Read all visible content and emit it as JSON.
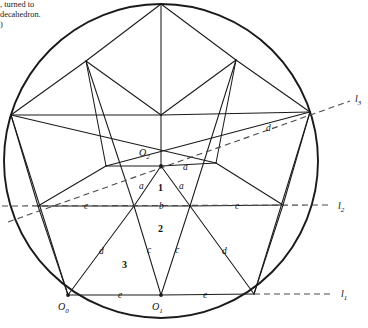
{
  "caption": {
    "text": ", turned to\ndecahedron.\n)"
  },
  "figure": {
    "circle": {
      "cx": 161,
      "cy": 161,
      "r": 157,
      "stroke": "#1a1a1a",
      "width": 1.9
    },
    "stroke_color": "#1a1a1a",
    "dash_color": "#4a4a4a",
    "points": {
      "apex": {
        "x": 161,
        "y": 4,
        "name": "apex-vertex"
      },
      "top_left": {
        "x": 86,
        "y": 61,
        "name": "top-left-vertex"
      },
      "top_right": {
        "x": 236,
        "y": 60,
        "name": "top-right-vertex"
      },
      "left": {
        "x": 11,
        "y": 115,
        "name": "left-vertex"
      },
      "right": {
        "x": 310,
        "y": 112,
        "name": "right-vertex"
      },
      "mid_top": {
        "x": 161,
        "y": 115,
        "name": "upper-center-node"
      },
      "inner_left": {
        "x": 106,
        "y": 166,
        "name": "inner-left-node"
      },
      "inner_right": {
        "x": 216,
        "y": 163,
        "name": "inner-right-node"
      },
      "O2": {
        "x": 161,
        "y": 166,
        "name": "point-O2"
      },
      "l2_left": {
        "x": 38,
        "y": 206,
        "name": "left-chord-node"
      },
      "l2_right": {
        "x": 283,
        "y": 205,
        "name": "right-chord-node"
      },
      "b_left": {
        "x": 134,
        "y": 206,
        "name": "b-left-node"
      },
      "b_right": {
        "x": 190,
        "y": 206,
        "name": "b-right-node"
      },
      "O0": {
        "x": 68,
        "y": 295,
        "name": "point-O0"
      },
      "O1": {
        "x": 161,
        "y": 295,
        "name": "point-O1"
      },
      "bottom_right": {
        "x": 254,
        "y": 294,
        "name": "bottom-right-vertex"
      }
    },
    "labels": [
      {
        "id": "a-top",
        "text": "a",
        "x": 183,
        "y": 170,
        "name": "edge-label-a-top"
      },
      {
        "id": "a-left",
        "text": "a",
        "x": 139,
        "y": 189,
        "name": "edge-label-a-left"
      },
      {
        "id": "a-right",
        "text": "a",
        "x": 179,
        "y": 189,
        "name": "edge-label-a-right"
      },
      {
        "id": "b",
        "text": "b",
        "x": 159,
        "y": 209,
        "name": "edge-label-b"
      },
      {
        "id": "c-left",
        "text": "c",
        "x": 84,
        "y": 209,
        "name": "edge-label-c-left"
      },
      {
        "id": "c-right",
        "text": "c",
        "x": 235,
        "y": 209,
        "name": "edge-label-c-right"
      },
      {
        "id": "c-low-l",
        "text": "c",
        "x": 147,
        "y": 253,
        "name": "edge-label-c-lower-left"
      },
      {
        "id": "c-low-r",
        "text": "c",
        "x": 175,
        "y": 253,
        "name": "edge-label-c-lower-right"
      },
      {
        "id": "d-upper",
        "text": "d",
        "x": 266,
        "y": 131,
        "name": "edge-label-d-upper"
      },
      {
        "id": "d-lower-l",
        "text": "d",
        "x": 99,
        "y": 254,
        "name": "edge-label-d-lower-left"
      },
      {
        "id": "d-lower-r",
        "text": "d",
        "x": 222,
        "y": 254,
        "name": "edge-label-d-lower-right"
      },
      {
        "id": "e-left",
        "text": "e",
        "x": 118,
        "y": 298,
        "name": "edge-label-e-left"
      },
      {
        "id": "e-right",
        "text": "e",
        "x": 203,
        "y": 298,
        "name": "edge-label-e-right"
      }
    ],
    "regions": [
      {
        "id": "r1",
        "text": "1",
        "x": 158,
        "y": 191,
        "name": "region-label-1"
      },
      {
        "id": "r2",
        "text": "2",
        "x": 158,
        "y": 232,
        "name": "region-label-2"
      },
      {
        "id": "r3",
        "text": "3",
        "x": 122,
        "y": 268,
        "name": "region-label-3"
      }
    ],
    "point_labels": [
      {
        "id": "O2",
        "base": "O",
        "sub": "2",
        "x": 139,
        "y": 156,
        "name": "point-label-O2"
      },
      {
        "id": "O0",
        "base": "O",
        "sub": "0",
        "x": 58,
        "y": 310,
        "name": "point-label-O0"
      },
      {
        "id": "O1",
        "base": "O",
        "sub": "1",
        "x": 152,
        "y": 310,
        "name": "point-label-O1"
      }
    ],
    "axes": [
      {
        "id": "l1",
        "base": "l",
        "sub": "1",
        "x1": 254,
        "y1": 294,
        "x2": 334,
        "y2": 294,
        "lx": 341,
        "ly": 297,
        "name": "axis-line-l1"
      },
      {
        "id": "l2",
        "base": "l",
        "sub": "2",
        "x1": 2,
        "y1": 206,
        "x2": 330,
        "y2": 205,
        "lx": 338,
        "ly": 209,
        "name": "axis-line-l2"
      },
      {
        "id": "l3",
        "base": "l",
        "sub": "3",
        "x1": 8,
        "y1": 222,
        "x2": 350,
        "y2": 101,
        "lx": 355,
        "ly": 102,
        "name": "axis-line-l3"
      }
    ]
  }
}
